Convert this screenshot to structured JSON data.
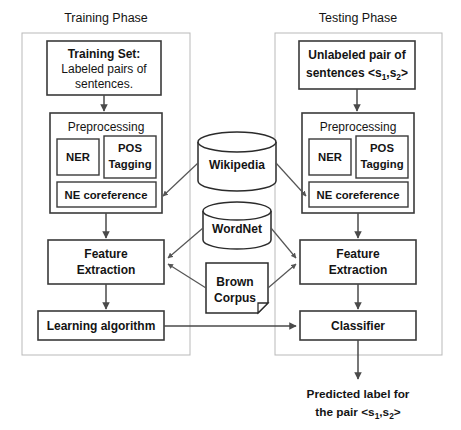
{
  "diagram": {
    "title_left": "Training Phase",
    "title_right": "Testing Phase",
    "training": {
      "input_box": {
        "line1": "Training Set:",
        "line2": "Labeled pairs of",
        "line3": "sentences."
      },
      "preprocessing": {
        "header": "Preprocessing",
        "ner": "NER",
        "pos_line1": "POS",
        "pos_line2": "Tagging",
        "coref": "NE coreference"
      },
      "feature_extraction": {
        "line1": "Feature",
        "line2": "Extraction"
      },
      "learner": "Learning algorithm"
    },
    "testing": {
      "input_box": {
        "line1": "Unlabeled pair of",
        "line2_prefix": "sentences <s",
        "line2_sub1": "1",
        "line2_mid": ",s",
        "line2_sub2": "2",
        "line2_suffix": ">"
      },
      "preprocessing": {
        "header": "Preprocessing",
        "ner": "NER",
        "pos_line1": "POS",
        "pos_line2": "Tagging",
        "coref": "NE coreference"
      },
      "feature_extraction": {
        "line1": "Feature",
        "line2": "Extraction"
      },
      "classifier": "Classifier"
    },
    "resources": {
      "wikipedia": "Wikipedia",
      "wordnet": "WordNet",
      "brown_line1": "Brown",
      "brown_line2": "Corpus"
    },
    "output": {
      "line1": "Predicted label for",
      "line2_prefix": "the pair <s",
      "line2_sub1": "1",
      "line2_mid": ",s",
      "line2_sub2": "2",
      "line2_suffix": ">"
    },
    "colors": {
      "frame": "#b9b9b9",
      "box_stroke": "#3a3a3a",
      "connector": "#4a4a4a",
      "text": "#141414",
      "background": "#ffffff"
    }
  }
}
